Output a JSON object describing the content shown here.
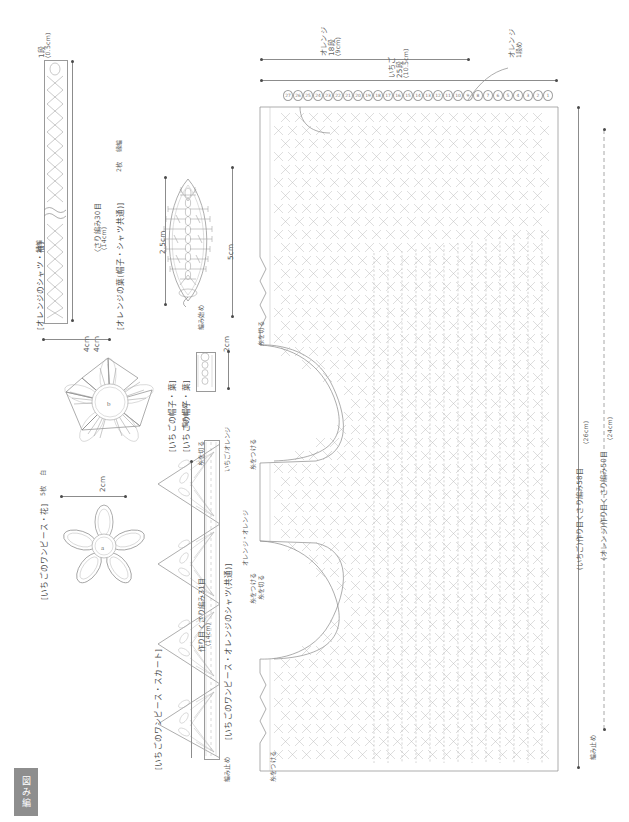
{
  "document": {
    "type": "japanese-crochet-pattern-diagram",
    "corner_badge": "編み図",
    "corner_badge_chars": [
      "図",
      "み",
      "編"
    ]
  },
  "sleeve_piece": {
    "title": "[オレンジのシャツ・袖]",
    "suffix": "縁編",
    "row_label": "1段",
    "row_size": "(0.5cm)",
    "width_label": "4cm",
    "chain_label": "〈さり編み30目",
    "chain_size": "(14cm)"
  },
  "leaf_piece": {
    "title": "[オレンジの葉(帽子・シャツ共通)]",
    "count": "2枚",
    "suffix": "縁編",
    "width_label": "2.5cm",
    "height_label": "5cm",
    "start_label": "編み始め"
  },
  "hat_flower": {
    "title": "[いちごの帽子・葉]",
    "width_label": "4cm",
    "center_label": "b"
  },
  "dress_flower": {
    "title": "[いちごのワンピース・花]",
    "count": "5枚",
    "suffix": "白",
    "width_label": "2cm",
    "center_label": "a"
  },
  "stem_piece": {
    "title": "[いちごの帽子・葉]",
    "width_label": "2cm",
    "end_label": "編み止め"
  },
  "skirt_piece": {
    "title": "[いちごのワンピース・スカート]",
    "chain_label": "作り目くさり編み31目",
    "chain_size": "(14cm)",
    "end_label": "編み止め",
    "edge_label": "糸を切る"
  },
  "body_piece": {
    "title": "[いちごのワンピース・オレンジのシャツ(共通)]",
    "colors": "いちご/オレンジ",
    "top": {
      "orange_rows": "オレンジ",
      "orange_rows_count": "18段",
      "orange_rows_size": "(9cm)",
      "strawberry_rows": "いちご",
      "strawberry_rows_count": "25段",
      "strawberry_rows_size": "(10.5cm)",
      "orange_first_row": "オレンジ",
      "orange_first_row_sub": "1段め"
    },
    "right": {
      "strawberry_chain": "(いちご)作り目くさり編み58目",
      "strawberry_size": "(26cm)",
      "orange_chain": "(オレンジ)作り目くさり編み50目",
      "orange_size": "(24cm)"
    },
    "annotations": {
      "attach_yarn": "糸をつける",
      "cut_yarn": "糸を切る",
      "colors_note": "オレンジ・オレンジ",
      "end_label": "編み止め"
    },
    "stitch_counts": [
      "27",
      "26",
      "25",
      "24",
      "23",
      "22",
      "21",
      "20",
      "19",
      "18",
      "17",
      "16",
      "15",
      "14",
      "13",
      "12",
      "11",
      "10",
      "9",
      "8",
      "7",
      "6",
      "5",
      "4",
      "3",
      "2",
      "1"
    ]
  }
}
